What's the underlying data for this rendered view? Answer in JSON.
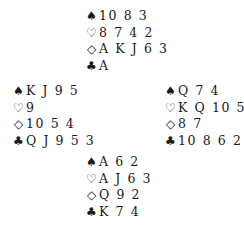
{
  "suit_icons": {
    "spades": "♠",
    "hearts": "♡",
    "diamonds": "◇",
    "clubs": "♣"
  },
  "hands": {
    "north": {
      "spades": "10 8 3",
      "hearts": "8 7 4 2",
      "diamonds": "A K J 6 3",
      "clubs": "A"
    },
    "west": {
      "spades": "K J 9 5",
      "hearts": "9",
      "diamonds": "10 5 4",
      "clubs": "Q J 9 5 3"
    },
    "east": {
      "spades": "Q 7 4",
      "hearts": "K Q 10 5",
      "diamonds": "8 7",
      "clubs": "10 8 6 2"
    },
    "south": {
      "spades": "A 6 2",
      "hearts": "A J 6 3",
      "diamonds": "Q 9 2",
      "clubs": "K 7 4"
    }
  }
}
